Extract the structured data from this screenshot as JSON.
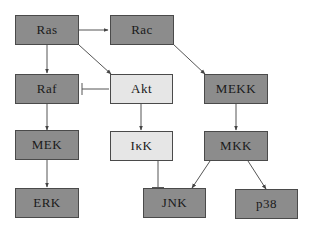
{
  "diagram": {
    "type": "signaling-pathway",
    "colors": {
      "dark_node": "#8c8c8c",
      "light_node": "#e6e6e6",
      "edge": "#555555",
      "border": "#4a4a4a"
    },
    "nodes": {
      "ras": {
        "label": "Ras",
        "style": "dark"
      },
      "rac": {
        "label": "Rac",
        "style": "dark"
      },
      "raf": {
        "label": "Raf",
        "style": "dark"
      },
      "akt": {
        "label": "Akt",
        "style": "light"
      },
      "mekk": {
        "label": "MEKK",
        "style": "dark"
      },
      "mek": {
        "label": "MEK",
        "style": "dark"
      },
      "ikk": {
        "label": "IκK",
        "style": "light"
      },
      "mkk": {
        "label": "MKK",
        "style": "dark"
      },
      "erk": {
        "label": "ERK",
        "style": "dark"
      },
      "jnk": {
        "label": "JNK",
        "style": "dark"
      },
      "p38": {
        "label": "p38",
        "style": "dark"
      }
    },
    "edges": [
      {
        "from": "Ras",
        "to": "Rac",
        "type": "activation"
      },
      {
        "from": "Ras",
        "to": "Raf",
        "type": "activation"
      },
      {
        "from": "Ras",
        "to": "Akt",
        "type": "activation"
      },
      {
        "from": "Rac",
        "to": "MEKK",
        "type": "activation"
      },
      {
        "from": "Akt",
        "to": "Raf",
        "type": "inhibition"
      },
      {
        "from": "Akt",
        "to": "IκK",
        "type": "activation"
      },
      {
        "from": "Raf",
        "to": "MEK",
        "type": "activation"
      },
      {
        "from": "MEK",
        "to": "ERK",
        "type": "activation"
      },
      {
        "from": "MEKK",
        "to": "MKK",
        "type": "activation"
      },
      {
        "from": "IκK",
        "to": "JNK",
        "type": "inhibition"
      },
      {
        "from": "MKK",
        "to": "JNK",
        "type": "activation"
      },
      {
        "from": "MKK",
        "to": "p38",
        "type": "activation"
      }
    ]
  }
}
